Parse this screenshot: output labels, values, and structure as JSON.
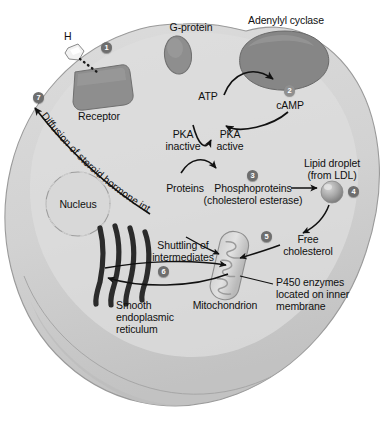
{
  "figure": {
    "type": "cell-signaling-diagram",
    "background_color": "#ffffff",
    "cell_fill": "#d3d3d3",
    "cell_rim": "#b4b4b4",
    "organelle_color": "#8c8c8c",
    "badge_color": "#6e6e6e"
  },
  "labels": {
    "hormone": "H",
    "receptor": "Receptor",
    "g_protein": "G-protein",
    "adenylyl_cyclase": "Adenylyl cyclase",
    "atp": "ATP",
    "camp": "cAMP",
    "pka_inactive_l1": "PKA",
    "pka_inactive_l2": "inactive",
    "pka_active_l1": "PKA",
    "pka_active_l2": "active",
    "proteins": "Proteins",
    "phosphoproteins_l1": "Phosphoproteins",
    "phosphoproteins_l2": "(cholesterol esterase)",
    "lipid_droplet_l1": "Lipid droplet",
    "lipid_droplet_l2": "(from LDL)",
    "free_cholesterol_l1": "Free",
    "free_cholesterol_l2": "cholesterol",
    "nucleus": "Nucleus",
    "shuttling_l1": "Shuttling of",
    "shuttling_l2": "intermediates",
    "smooth_er_l1": "Smooth",
    "smooth_er_l2": "endoplasmic",
    "smooth_er_l3": "reticulum",
    "mitochondrion": "Mitochondrion",
    "p450_l1": "P450 enzymes",
    "p450_l2": "located on inner",
    "p450_l3": "membrane",
    "diffusion": "Diffusion of steroid hormone into blood"
  },
  "badges": [
    {
      "n": "1",
      "label": "hormone-binds-receptor"
    },
    {
      "n": "2",
      "label": "adenylyl-cyclase-makes-camp"
    },
    {
      "n": "3",
      "label": "pka-phosphorylates-proteins"
    },
    {
      "n": "4",
      "label": "lipid-droplet-hydrolysis"
    },
    {
      "n": "5",
      "label": "cholesterol-enters-mitochondrion"
    },
    {
      "n": "6",
      "label": "shuttling-between-mitochondrion-and-ser"
    },
    {
      "n": "7",
      "label": "steroid-diffuses-into-blood"
    }
  ],
  "steps": [
    {
      "number": "1",
      "text": "Hormone (H) binds the membrane Receptor"
    },
    {
      "number": "2",
      "text": "Adenylyl cyclase converts ATP to cAMP"
    },
    {
      "number": "3",
      "text": "PKA active converts Proteins to Phosphoproteins (cholesterol esterase)"
    },
    {
      "number": "4",
      "text": "Lipid droplet (from LDL) yields Free cholesterol"
    },
    {
      "number": "5",
      "text": "Free cholesterol enters the Mitochondrion"
    },
    {
      "number": "6",
      "text": "Shuttling of intermediates between mitochondrion and smooth endoplasmic reticulum"
    },
    {
      "number": "7",
      "text": "Diffusion of steroid hormone into blood"
    }
  ]
}
